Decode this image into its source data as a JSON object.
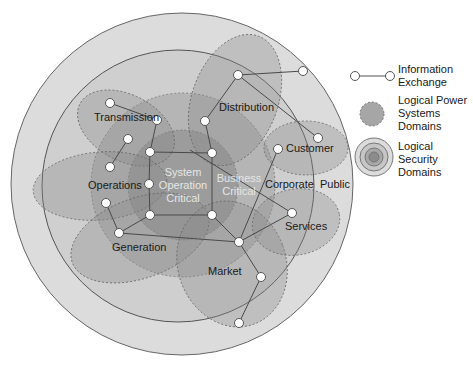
{
  "diagram": {
    "security_domains": {
      "public": "Public",
      "corporate": "Corporate",
      "business_critical": [
        "Business",
        "Critical"
      ],
      "system_operation_critical": [
        "System",
        "Operation",
        "Critical"
      ]
    },
    "power_domains": {
      "transmission": "Transmission",
      "distribution": "Distribution",
      "customer": "Customer",
      "operations": "Operations",
      "generation": "Generation",
      "market": "Market",
      "services": "Services"
    }
  },
  "legend": {
    "information_exchange": [
      "Information",
      "Exchange"
    ],
    "logical_power_systems_domains": [
      "Logical Power",
      "Systems",
      "Domains"
    ],
    "logical_security_domains": [
      "Logical",
      "Security",
      "Domains"
    ]
  },
  "colors": {
    "outer_ring": "#dcdcdc",
    "corporate_ring": "#cfcfcf",
    "business_ring": "#b8b8b8",
    "system_core": "#a0a0a0",
    "domain_fill": "#8c8c8c",
    "node_fill": "#ffffff",
    "line": "#555555"
  }
}
